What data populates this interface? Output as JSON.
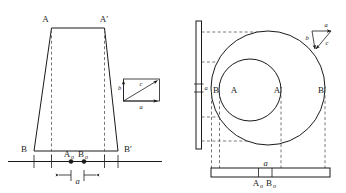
{
  "figure": {
    "background_color": "#ffffff",
    "ink_color": "#1a1a1a",
    "dashed_color": "#555555"
  },
  "left_view": {
    "name": "front-elevation-trapezoid",
    "vertex_labels": {
      "top_left": "A",
      "top_right": "A′",
      "bottom_left": "B",
      "bottom_right": "B′"
    },
    "ground_labels": {
      "point_a": "A",
      "point_a_sub": "o",
      "point_b": "B",
      "point_b_sub": "o"
    },
    "dimension_label": "a",
    "vector_triangle": {
      "name": "velocity-triangle-left",
      "vertical_label": "b",
      "diagonal_label": "c",
      "horizontal_label": "a"
    }
  },
  "right_view": {
    "name": "plan-view-circles",
    "circle_labels": {
      "outer_left": "B",
      "inner_left": "A",
      "inner_right": "A′",
      "outer_right": "B′"
    },
    "vertical_bar_label": "a",
    "bottom_bar_dimension": "a",
    "bottom_bar_labels": {
      "point_a": "A",
      "point_a_sub": "o",
      "point_b": "B",
      "point_b_sub": "o"
    },
    "vector_triangle": {
      "name": "velocity-triangle-right",
      "top_label": "a",
      "vertical_label": "b",
      "diagonal_label": "c"
    }
  }
}
